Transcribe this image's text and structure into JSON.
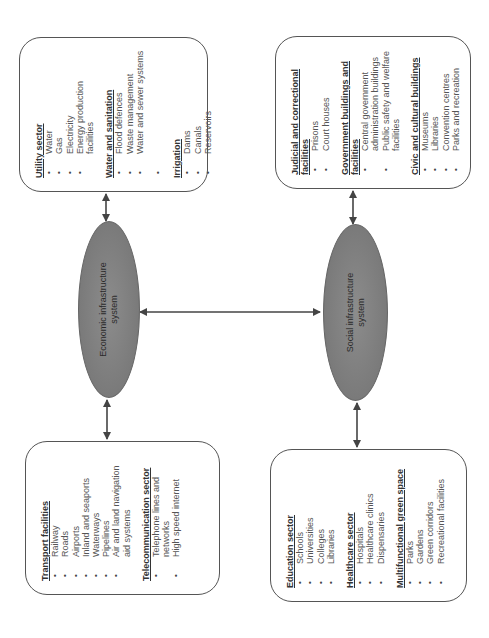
{
  "diagram": {
    "center_nodes": {
      "economic": {
        "label_line1": "Economic infrastructure",
        "label_line2": "system"
      },
      "social": {
        "label_line1": "Social infrastructure",
        "label_line2": "system"
      }
    },
    "boxes": {
      "utility": {
        "sections": [
          {
            "heading": "Utility sector",
            "items": [
              "Water",
              "Gas",
              "Electricity",
              "Energy production facilities"
            ]
          },
          {
            "heading": "Water and sanitation",
            "items": [
              "Flood defences",
              "Waste management",
              "Water and sewer systems",
              ""
            ]
          },
          {
            "heading": "Irrigation",
            "items": [
              "Dams",
              "Canals",
              "Reservoirs"
            ]
          }
        ]
      },
      "transport": {
        "sections": [
          {
            "heading": "Transport facilities",
            "items": [
              "Railway",
              "Roads",
              "Airports",
              "Inland and seaports",
              "Waterways",
              "Pipelines",
              "Air and land navigation aid systems"
            ]
          },
          {
            "heading": "Telecommunication sector",
            "items": [
              "Telephone lines and networks",
              "High speed internet"
            ]
          }
        ]
      },
      "judicial": {
        "sections": [
          {
            "heading": "Judicial and correctional facilities",
            "items": [
              "Prisons",
              "Court houses"
            ]
          },
          {
            "heading": "Government buildings and facilities",
            "items": [
              "Central government administration buildings",
              "Public safety and welfare facilities"
            ]
          },
          {
            "heading": "Civic and cultural buildings",
            "items": [
              "Museums",
              "Libraries",
              "Convention centres",
              "Parks and recreation"
            ]
          }
        ]
      },
      "education": {
        "sections": [
          {
            "heading": "Education sector",
            "items": [
              "Schools",
              "Universities",
              "Colleges",
              "Libraries"
            ]
          },
          {
            "heading": "Healthcare sector",
            "items": [
              "Hospitals",
              "Healthcare clinics",
              "Dispensaries"
            ]
          },
          {
            "heading": "Multifunctional green space",
            "items": [
              "Parks",
              "Gardens",
              "Green corridors",
              "Recreational facilities"
            ]
          }
        ]
      }
    },
    "colors": {
      "ellipse_fill": "#7f7f7f",
      "border": "#555555",
      "arrow": "#444444",
      "text": "#333333"
    }
  }
}
